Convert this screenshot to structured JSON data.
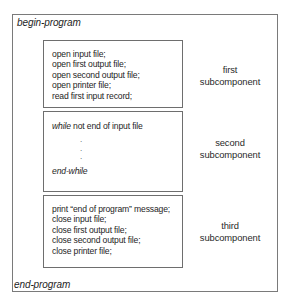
{
  "diagram": {
    "begin_label": "begin-program",
    "end_label": "end-program",
    "subcomponents": [
      {
        "caption_line1": "first",
        "caption_line2": "subcomponent",
        "lines": [
          "open input file;",
          "open first output file;",
          "open second output file;",
          "open printer file;",
          "read first input record;"
        ]
      },
      {
        "caption_line1": "second",
        "caption_line2": "subcomponent",
        "while_keyword": "while",
        "while_condition": " not end of input file",
        "ellipsis_dots": [
          ".",
          ".",
          "."
        ],
        "end_while": "end-while"
      },
      {
        "caption_line1": "third",
        "caption_line2": "subcomponent",
        "lines": [
          "print “end of program” message;",
          "close input file;",
          "close first output file;",
          "close second output file;",
          "close printer file;"
        ]
      }
    ]
  }
}
